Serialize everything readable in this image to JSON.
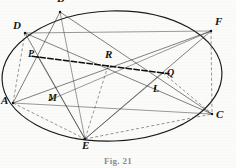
{
  "figure": {
    "caption": "Fig. 21",
    "canvas": {
      "width": 236,
      "height": 168
    },
    "colors": {
      "ink": "#1a1a18",
      "chord": "#333330",
      "dashed": "#4a4a46",
      "pascal": "#0d0d0c",
      "background": "#fbfbf9",
      "caption": "#8d8d88"
    },
    "conic": {
      "type": "ellipse",
      "cx": 112,
      "cy": 76,
      "rx": 110,
      "ry": 65,
      "rotation": -2
    },
    "points": [
      {
        "id": "A",
        "label": "A",
        "x": 13,
        "y": 103,
        "on_conic": true,
        "label_dx": -12,
        "label_dy": -2
      },
      {
        "id": "B",
        "label": "B",
        "x": 60,
        "y": 12,
        "on_conic": true,
        "label_dx": -3,
        "label_dy": -13
      },
      {
        "id": "C",
        "label": "C",
        "x": 212,
        "y": 114,
        "on_conic": true,
        "label_dx": 4,
        "label_dy": 1
      },
      {
        "id": "D",
        "label": "D",
        "x": 25,
        "y": 33,
        "on_conic": true,
        "label_dx": -12,
        "label_dy": -7
      },
      {
        "id": "E",
        "label": "E",
        "x": 85,
        "y": 139,
        "on_conic": true,
        "label_dx": -3,
        "label_dy": 7
      },
      {
        "id": "F",
        "label": "F",
        "x": 211,
        "y": 31,
        "on_conic": true,
        "label_dx": 4,
        "label_dy": -9
      },
      {
        "id": "P",
        "label": "P",
        "x": 38,
        "y": 57,
        "on_conic": false,
        "label_dx": -10,
        "label_dy": -2
      },
      {
        "id": "Q",
        "label": "Q",
        "x": 163,
        "y": 73,
        "on_conic": false,
        "label_dx": 4,
        "label_dy": 1
      },
      {
        "id": "R",
        "label": "R",
        "x": 108,
        "y": 66,
        "on_conic": false,
        "label_dx": -3,
        "label_dy": -11
      },
      {
        "id": "L",
        "label": "L",
        "x": 155,
        "y": 88,
        "on_conic": false,
        "label_dx": -2,
        "label_dy": 2
      },
      {
        "id": "M",
        "label": "M",
        "x": 50,
        "y": 100,
        "on_conic": false,
        "label_dx": -2,
        "label_dy": -1
      }
    ],
    "segments": [
      {
        "name": "A-B",
        "from": "A",
        "to": "B",
        "style": "chord"
      },
      {
        "name": "B-C",
        "from": "B",
        "to": "C",
        "style": "chord"
      },
      {
        "name": "C-D",
        "from": "C",
        "to": "D",
        "style": "chord"
      },
      {
        "name": "D-E",
        "from": "D",
        "to": "E",
        "style": "chord"
      },
      {
        "name": "E-F",
        "from": "E",
        "to": "F",
        "style": "chord"
      },
      {
        "name": "F-A",
        "from": "F",
        "to": "A",
        "style": "chord"
      },
      {
        "name": "A-C",
        "from": "A",
        "to": "C",
        "style": "chord-thin"
      },
      {
        "name": "B-E",
        "from": "B",
        "to": "E",
        "style": "chord-thin"
      },
      {
        "name": "D-F",
        "from": "D",
        "to": "F",
        "style": "chord-thin"
      },
      {
        "name": "D-A-dashed",
        "from": "D",
        "to": "A",
        "style": "dashed"
      },
      {
        "name": "F-C-dashed",
        "from": "F",
        "to": "C",
        "style": "dashed"
      },
      {
        "name": "A-E-dashed",
        "from": "A",
        "to": "E",
        "style": "dashed"
      },
      {
        "name": "E-C-dashed",
        "from": "E",
        "to": "C",
        "style": "dashed"
      },
      {
        "name": "R-E-dashed",
        "from": "R",
        "to": "E",
        "style": "dashed"
      },
      {
        "name": "Q-C-dashed",
        "from": "Q",
        "to": "C",
        "style": "dashed"
      },
      {
        "name": "P-E",
        "from": "P",
        "to": "E",
        "style": "chord-thin"
      },
      {
        "name": "M-F",
        "from": "M",
        "to": "F",
        "style": "chord-thin"
      },
      {
        "name": "E-Q",
        "from": "E",
        "to": "Q",
        "style": "chord-thin"
      }
    ],
    "pascal_line": {
      "name": "pascal-line",
      "from": "P",
      "to": "Q",
      "through": "R",
      "style": "pascal-line",
      "extend_start": 6,
      "extend_end": 6
    }
  }
}
